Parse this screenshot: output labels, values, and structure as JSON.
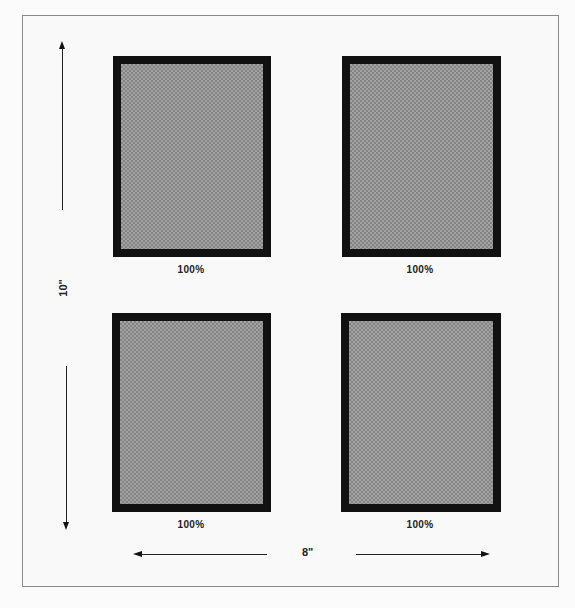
{
  "diagram": {
    "frames": [
      {
        "id": "top-left",
        "label": "100%"
      },
      {
        "id": "top-right",
        "label": "100%"
      },
      {
        "id": "bottom-left",
        "label": "100%"
      },
      {
        "id": "bottom-right",
        "label": "100%"
      }
    ],
    "dimensions": {
      "height_label": "10\"",
      "width_label": "8\""
    },
    "colors": {
      "frame_border": "#111111",
      "frame_fill": "#9a9a9a",
      "page_border": "#8a8a8a",
      "background": "#fbfbfb"
    }
  }
}
